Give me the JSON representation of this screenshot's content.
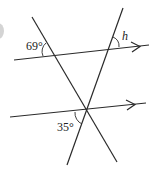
{
  "diagram": {
    "type": "parallel lines cut by transversals",
    "labels": {
      "angle_top_left": "69°",
      "angle_top_right": "h",
      "angle_bottom": "35°"
    },
    "lines": {
      "upper_parallel": "line with arrow (parallel marker)",
      "lower_parallel": "line with arrow (parallel marker)",
      "transversal_left": "line descending from upper-left to lower-right",
      "transversal_right": "line descending from upper-right to lower-left"
    },
    "colors": {
      "line": "#2a2a2a",
      "background": "#ffffff",
      "edge_marker": "#c8c8c8"
    }
  }
}
